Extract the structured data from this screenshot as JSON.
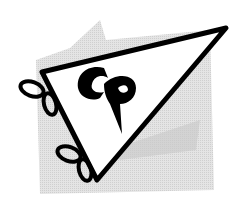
{
  "logo": {
    "monogram": "CP",
    "colors": {
      "background": "#ffffff",
      "shadow": "#d9d9d9",
      "stroke": "#000000",
      "fill": "#ffffff"
    }
  }
}
